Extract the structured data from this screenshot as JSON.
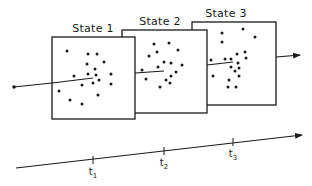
{
  "diagram": {
    "states": [
      {
        "label": "State 1",
        "box": {
          "x": 52,
          "y": 37,
          "w": 83,
          "h": 82
        },
        "label_pos": {
          "x": 93,
          "y": 22
        },
        "trajectory": {
          "x1": 52,
          "y1": 83,
          "x2": 93,
          "y2": 78
        },
        "dots": [
          [
            67,
            51
          ],
          [
            88,
            54
          ],
          [
            97,
            54
          ],
          [
            104,
            62
          ],
          [
            87,
            64
          ],
          [
            95,
            69
          ],
          [
            88,
            74
          ],
          [
            96,
            75
          ],
          [
            111,
            74
          ],
          [
            74,
            76
          ],
          [
            99,
            80
          ],
          [
            93,
            83
          ],
          [
            82,
            85
          ],
          [
            111,
            84
          ],
          [
            59,
            91
          ],
          [
            98,
            95
          ],
          [
            70,
            100
          ],
          [
            82,
            104
          ]
        ]
      },
      {
        "label": "State 2",
        "box": {
          "x": 122,
          "y": 30,
          "w": 85,
          "h": 83
        },
        "label_pos": {
          "x": 160,
          "y": 15
        },
        "trajectory": {
          "x1": 135,
          "y1": 73,
          "x2": 164,
          "y2": 71
        },
        "dots": [
          [
            154,
            44
          ],
          [
            169,
            43
          ],
          [
            178,
            50
          ],
          [
            157,
            52
          ],
          [
            149,
            56
          ],
          [
            164,
            62
          ],
          [
            171,
            63
          ],
          [
            182,
            65
          ],
          [
            158,
            67
          ],
          [
            142,
            70
          ],
          [
            176,
            72
          ],
          [
            171,
            76
          ],
          [
            146,
            79
          ],
          [
            166,
            80
          ],
          [
            170,
            83
          ],
          [
            160,
            87
          ]
        ]
      },
      {
        "label": "State 3",
        "box": {
          "x": 192,
          "y": 22,
          "w": 84,
          "h": 83
        },
        "label_pos": {
          "x": 226,
          "y": 7
        },
        "trajectory": {
          "x1": 207,
          "y1": 65,
          "x2": 233,
          "y2": 62
        },
        "dots": [
          [
            243,
            29
          ],
          [
            222,
            33
          ],
          [
            255,
            37
          ],
          [
            222,
            42
          ],
          [
            245,
            52
          ],
          [
            237,
            54
          ],
          [
            225,
            59
          ],
          [
            231,
            59
          ],
          [
            246,
            58
          ],
          [
            211,
            60
          ],
          [
            238,
            63
          ],
          [
            231,
            67
          ],
          [
            239,
            68
          ],
          [
            235,
            71
          ],
          [
            213,
            76
          ],
          [
            239,
            76
          ],
          [
            229,
            80
          ],
          [
            228,
            87
          ],
          [
            236,
            87
          ]
        ]
      }
    ],
    "entry": {
      "start_x": 14,
      "start_y": 87,
      "end_x": 52,
      "end_y": 83
    },
    "exit_arrow": {
      "x1": 276,
      "y1": 57,
      "x2": 300,
      "y2": 55
    },
    "timeline": {
      "x1": 16,
      "y1": 168,
      "x2": 302,
      "y2": 135,
      "ticks": [
        {
          "label": "t",
          "sub": "1",
          "x": 93,
          "y": 160
        },
        {
          "label": "t",
          "sub": "2",
          "x": 164,
          "y": 151
        },
        {
          "label": "t",
          "sub": "3",
          "x": 233,
          "y": 142
        }
      ]
    },
    "colors": {
      "ink": "#1a1a1a",
      "background": "#ffffff"
    }
  }
}
